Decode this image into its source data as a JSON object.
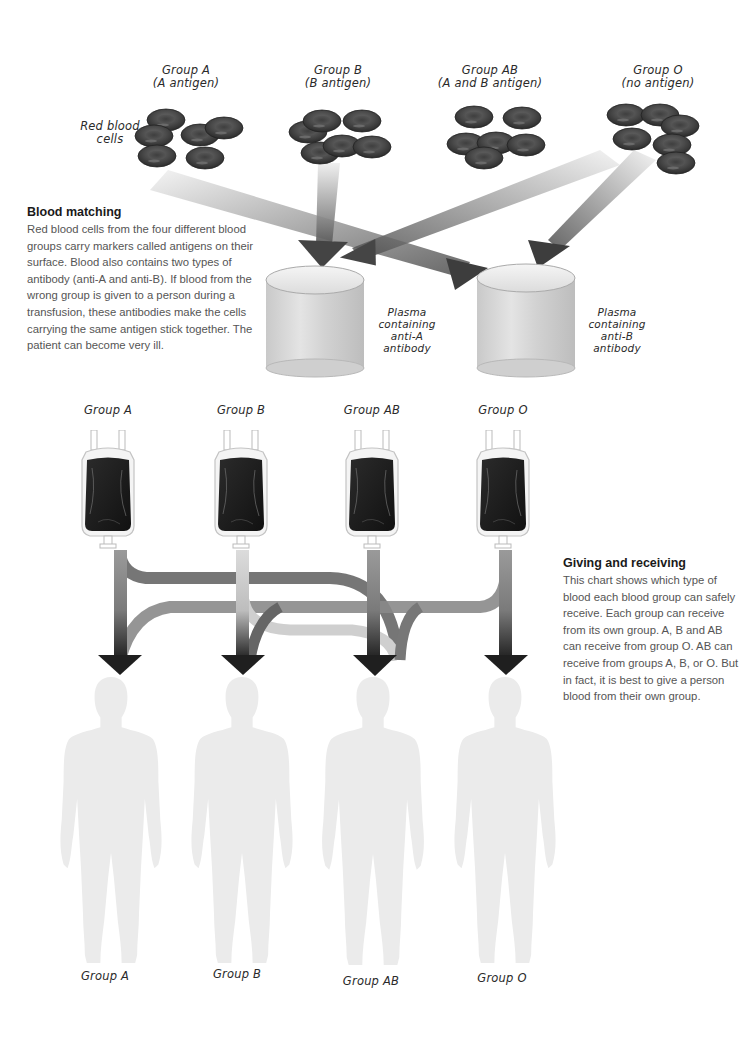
{
  "donor_cells": {
    "side_label": "Red blood cells",
    "groups": [
      {
        "name": "Group A",
        "antigen": "(A antigen)"
      },
      {
        "name": "Group B",
        "antigen": "(B antigen)"
      },
      {
        "name": "Group AB",
        "antigen": "(A and B antigen)"
      },
      {
        "name": "Group O",
        "antigen": "(no antigen)"
      }
    ]
  },
  "plasma": [
    {
      "label_line1": "Plasma",
      "label_line2": "containing",
      "label_line3": "anti-A",
      "label_line4": "antibody"
    },
    {
      "label_line1": "Plasma",
      "label_line2": "containing",
      "label_line3": "anti-B",
      "label_line4": "antibody"
    }
  ],
  "blood_matching": {
    "title": "Blood matching",
    "body": "Red blood cells from the four different blood groups carry markers called antigens on their surface. Blood also contains two types of antibody (anti-A and anti-B). If blood from the wrong group is given to a person during a transfusion, these antibodies make the cells carrying the same antigen stick together. The patient can become very ill."
  },
  "blood_bags": {
    "labels": [
      "Group A",
      "Group B",
      "Group AB",
      "Group O"
    ]
  },
  "giving_receiving": {
    "title": "Giving and receiving",
    "body": "This chart shows which type of blood each blood group can safely receive. Each group can receive from its own group. A, B and AB can receive from group O. AB can receive from groups A, B, or O. But in fact, it is best to give a person blood from their own group."
  },
  "recipients": {
    "labels": [
      "Group A",
      "Group B",
      "Group AB",
      "Group O"
    ]
  },
  "compatibility": {
    "Group A": [
      "Group A",
      "Group O"
    ],
    "Group B": [
      "Group B",
      "Group O"
    ],
    "Group AB": [
      "Group A",
      "Group B",
      "Group AB",
      "Group O"
    ],
    "Group O": [
      "Group O"
    ]
  },
  "colors": {
    "background": "#ffffff",
    "cell": "#4a4a4a",
    "bag_blood": "#1c1c1c",
    "arrow_dark": "#222222",
    "silhouette": "#ececec",
    "body_text": "#555555"
  }
}
